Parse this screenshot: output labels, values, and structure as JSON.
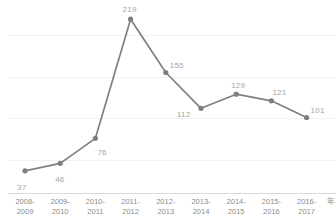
{
  "chart_data": {
    "type": "line",
    "title": "",
    "subtitle": "",
    "xlabel": "",
    "ylabel": "",
    "categories": [
      "2008-\n2009",
      "2009-\n2010",
      "2010-\n2011",
      "2011-\n2012",
      "2012-\n2013",
      "2013-\n2014",
      "2014-\n2015",
      "2015-\n2016",
      "2016-\n2017"
    ],
    "category_lines": [
      [
        "2008-",
        "2009"
      ],
      [
        "2009-",
        "2010"
      ],
      [
        "2010-",
        "2011"
      ],
      [
        "2011-",
        "2012"
      ],
      [
        "2012-",
        "2013"
      ],
      [
        "2013-",
        "2014"
      ],
      [
        "2014-",
        "2015"
      ],
      [
        "2015-",
        "2016"
      ],
      [
        "2016-",
        "2017"
      ]
    ],
    "values": [
      37,
      46,
      76,
      219,
      155,
      112,
      129,
      121,
      101
    ],
    "data_labels": [
      "37",
      "46",
      "76",
      "219",
      "155",
      "112",
      "129",
      "121",
      "101"
    ],
    "ylim": [
      0,
      219
    ],
    "gridline_values": [
      50,
      100,
      150,
      200
    ],
    "grid": true,
    "legend": false,
    "legend_position": "none",
    "markers": true,
    "axis_unit": "年",
    "series_color": "#808080",
    "marker_color": "#7f7f7f",
    "gridline_color": "#f2f2f2",
    "axis_color": "#d9d9d9",
    "label_color": "#a6a6a6",
    "tick_color": "#8c8c8c"
  },
  "label_offsets": [
    {
      "dx": -8,
      "dy": 12
    },
    {
      "dx": -5,
      "dy": 12
    },
    {
      "dx": 2,
      "dy": 10
    },
    {
      "dx": -8,
      "dy": -14
    },
    {
      "dx": 4,
      "dy": -12
    },
    {
      "dx": -24,
      "dy": 2
    },
    {
      "dx": -5,
      "dy": -13
    },
    {
      "dx": 1,
      "dy": -13
    },
    {
      "dx": 4,
      "dy": -12
    }
  ]
}
